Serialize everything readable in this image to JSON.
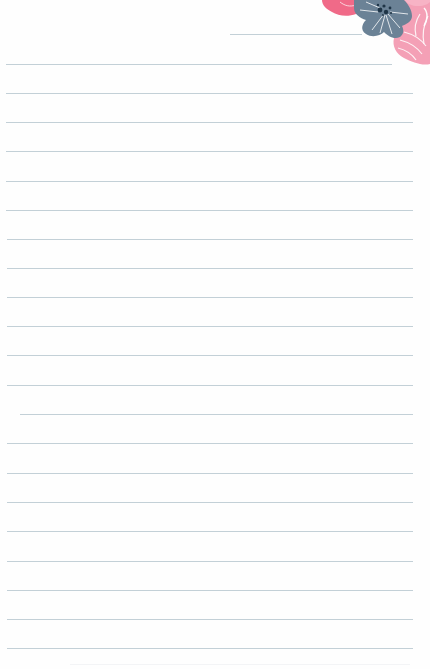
{
  "page": {
    "type": "lined-stationery",
    "background_color": "#fefefe",
    "width": 430,
    "height": 669
  },
  "rules": {
    "color": "#bccbd3",
    "thickness": 1,
    "spacing": 29.2,
    "header_line": {
      "x1": 230,
      "x2": 362,
      "y": 34
    },
    "lines": [
      {
        "y": 64,
        "x1": 6,
        "x2": 392
      },
      {
        "y": 93,
        "x1": 6,
        "x2": 413
      },
      {
        "y": 122,
        "x1": 6,
        "x2": 413
      },
      {
        "y": 151,
        "x1": 6,
        "x2": 413
      },
      {
        "y": 181,
        "x1": 6,
        "x2": 413
      },
      {
        "y": 210,
        "x1": 6,
        "x2": 413
      },
      {
        "y": 239,
        "x1": 7,
        "x2": 413
      },
      {
        "y": 268,
        "x1": 7,
        "x2": 413
      },
      {
        "y": 297,
        "x1": 7,
        "x2": 413
      },
      {
        "y": 326,
        "x1": 7,
        "x2": 413
      },
      {
        "y": 355,
        "x1": 7,
        "x2": 413
      },
      {
        "y": 385,
        "x1": 7,
        "x2": 413
      },
      {
        "y": 414,
        "x1": 20,
        "x2": 413
      },
      {
        "y": 443,
        "x1": 7,
        "x2": 413
      },
      {
        "y": 473,
        "x1": 7,
        "x2": 413
      },
      {
        "y": 502,
        "x1": 7,
        "x2": 413
      },
      {
        "y": 531,
        "x1": 7,
        "x2": 413
      },
      {
        "y": 561,
        "x1": 7,
        "x2": 413
      },
      {
        "y": 590,
        "x1": 7,
        "x2": 413
      },
      {
        "y": 619,
        "x1": 7,
        "x2": 413
      },
      {
        "y": 648,
        "x1": 7,
        "x2": 413
      }
    ]
  },
  "decoration": {
    "name": "corner-floral",
    "position": "top-right",
    "flowers": [
      {
        "name": "coral-flower",
        "color": "#f06a88"
      },
      {
        "name": "blue-gray-flower",
        "color": "#6b8296",
        "center_color": "#1f3547"
      },
      {
        "name": "light-pink-flower",
        "color": "#f4a0b6",
        "vein_color": "#ffffff"
      }
    ]
  }
}
